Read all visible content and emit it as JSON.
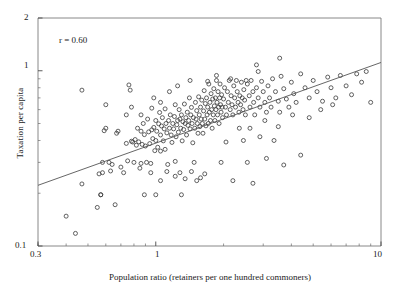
{
  "chart_data": {
    "type": "scatter",
    "title": "",
    "xlabel": "Population ratio (retainers per one hundred commoners)",
    "ylabel": "Taxation per capita",
    "xscale": "log",
    "yscale": "log",
    "xlim": [
      0.3,
      10
    ],
    "ylim": [
      0.1,
      2
    ],
    "xticks": [
      0.3,
      1,
      10
    ],
    "xtick_labels": [
      "0.3",
      "1",
      "10"
    ],
    "yticks": [
      0.1,
      1,
      2
    ],
    "ytick_labels": [
      "0.1",
      "1",
      "2"
    ],
    "grid": false,
    "legend": null,
    "annotations": [
      {
        "text": "r = 0.60",
        "x": 0.45,
        "y": 1.45
      }
    ],
    "correlation": 0.6,
    "marker": {
      "shape": "open-circle",
      "size_px": 4,
      "facecolor": "none",
      "edgecolor": "#3a3a3a"
    },
    "trendline": {
      "type": "linear-in-log-log",
      "color": "#555555",
      "points": [
        [
          0.3,
          0.222
        ],
        [
          10.0,
          1.115
        ]
      ]
    },
    "points": [
      [
        0.4,
        0.148
      ],
      [
        0.44,
        0.118
      ],
      [
        0.47,
        0.226
      ],
      [
        0.47,
        0.775
      ],
      [
        0.55,
        0.166
      ],
      [
        0.56,
        0.258
      ],
      [
        0.57,
        0.196
      ],
      [
        0.57,
        0.196
      ],
      [
        0.58,
        0.262
      ],
      [
        0.58,
        0.3
      ],
      [
        0.59,
        0.455
      ],
      [
        0.6,
        0.47
      ],
      [
        0.6,
        0.64
      ],
      [
        0.62,
        0.3
      ],
      [
        0.63,
        0.268
      ],
      [
        0.64,
        0.292
      ],
      [
        0.66,
        0.172
      ],
      [
        0.67,
        0.44
      ],
      [
        0.68,
        0.452
      ],
      [
        0.7,
        0.282
      ],
      [
        0.72,
        0.262
      ],
      [
        0.74,
        0.385
      ],
      [
        0.75,
        0.306
      ],
      [
        0.76,
        0.83
      ],
      [
        0.77,
        0.775
      ],
      [
        0.78,
        0.396
      ],
      [
        0.79,
        0.392
      ],
      [
        0.8,
        0.3
      ],
      [
        0.81,
        0.405
      ],
      [
        0.82,
        0.376
      ],
      [
        0.83,
        0.47
      ],
      [
        0.84,
        0.393
      ],
      [
        0.85,
        0.278
      ],
      [
        0.86,
        0.452
      ],
      [
        0.86,
        0.296
      ],
      [
        0.87,
        0.38
      ],
      [
        0.88,
        0.5
      ],
      [
        0.89,
        0.196
      ],
      [
        0.89,
        0.432
      ],
      [
        0.9,
        0.372
      ],
      [
        0.91,
        0.3
      ],
      [
        0.92,
        0.53
      ],
      [
        0.93,
        0.448
      ],
      [
        0.94,
        0.384
      ],
      [
        0.95,
        0.296
      ],
      [
        0.96,
        0.46
      ],
      [
        0.96,
        0.612
      ],
      [
        0.97,
        0.41
      ],
      [
        0.98,
        0.475
      ],
      [
        0.99,
        0.35
      ],
      [
        1.0,
        0.52
      ],
      [
        1.0,
        0.4
      ],
      [
        1.01,
        0.452
      ],
      [
        1.02,
        0.366
      ],
      [
        1.03,
        0.498
      ],
      [
        1.04,
        0.578
      ],
      [
        1.05,
        0.43
      ],
      [
        1.05,
        0.348
      ],
      [
        1.06,
        0.484
      ],
      [
        1.07,
        0.54
      ],
      [
        1.08,
        0.398
      ],
      [
        1.09,
        0.466
      ],
      [
        1.1,
        0.356
      ],
      [
        1.1,
        0.606
      ],
      [
        1.11,
        0.5
      ],
      [
        1.12,
        0.442
      ],
      [
        1.13,
        0.292
      ],
      [
        1.14,
        0.52
      ],
      [
        1.15,
        0.47
      ],
      [
        1.16,
        0.56
      ],
      [
        1.17,
        0.43
      ],
      [
        1.18,
        0.39
      ],
      [
        1.19,
        0.5
      ],
      [
        1.2,
        0.466
      ],
      [
        1.21,
        0.548
      ],
      [
        1.22,
        0.64
      ],
      [
        1.22,
        0.304
      ],
      [
        1.23,
        0.42
      ],
      [
        1.24,
        0.492
      ],
      [
        1.25,
        0.52
      ],
      [
        1.26,
        0.446
      ],
      [
        1.27,
        0.6
      ],
      [
        1.28,
        0.53
      ],
      [
        1.29,
        0.47
      ],
      [
        1.3,
        0.56
      ],
      [
        1.31,
        0.398
      ],
      [
        1.32,
        0.512
      ],
      [
        1.33,
        0.462
      ],
      [
        1.34,
        0.646
      ],
      [
        1.35,
        0.5
      ],
      [
        1.36,
        0.54
      ],
      [
        1.37,
        0.43
      ],
      [
        1.38,
        0.58
      ],
      [
        1.39,
        0.488
      ],
      [
        1.4,
        0.52
      ],
      [
        1.41,
        0.7
      ],
      [
        1.42,
        0.466
      ],
      [
        1.43,
        0.56
      ],
      [
        1.44,
        0.618
      ],
      [
        1.45,
        0.5
      ],
      [
        1.46,
        0.388
      ],
      [
        1.47,
        0.54
      ],
      [
        1.48,
        0.3
      ],
      [
        1.49,
        0.47
      ],
      [
        1.5,
        0.66
      ],
      [
        1.51,
        0.53
      ],
      [
        1.52,
        0.592
      ],
      [
        1.53,
        0.5
      ],
      [
        1.54,
        0.44
      ],
      [
        1.55,
        0.71
      ],
      [
        1.56,
        0.56
      ],
      [
        1.57,
        0.48
      ],
      [
        1.58,
        0.62
      ],
      [
        1.59,
        0.53
      ],
      [
        1.6,
        0.68
      ],
      [
        1.61,
        0.5
      ],
      [
        1.62,
        0.44
      ],
      [
        1.63,
        0.59
      ],
      [
        1.64,
        0.77
      ],
      [
        1.65,
        0.53
      ],
      [
        1.66,
        0.65
      ],
      [
        1.67,
        0.485
      ],
      [
        1.68,
        0.7
      ],
      [
        1.69,
        0.56
      ],
      [
        1.7,
        0.62
      ],
      [
        1.71,
        0.5
      ],
      [
        1.72,
        0.84
      ],
      [
        1.73,
        0.58
      ],
      [
        1.74,
        0.66
      ],
      [
        1.75,
        0.52
      ],
      [
        1.76,
        0.74
      ],
      [
        1.77,
        0.6
      ],
      [
        1.78,
        0.47
      ],
      [
        1.79,
        0.69
      ],
      [
        1.8,
        0.56
      ],
      [
        1.81,
        0.79
      ],
      [
        1.82,
        0.63
      ],
      [
        1.83,
        0.52
      ],
      [
        1.84,
        0.7
      ],
      [
        1.85,
        0.6
      ],
      [
        1.86,
        0.88
      ],
      [
        1.87,
        0.66
      ],
      [
        1.88,
        0.56
      ],
      [
        1.89,
        0.76
      ],
      [
        1.9,
        0.62
      ],
      [
        1.91,
        0.5
      ],
      [
        1.92,
        0.7
      ],
      [
        1.93,
        0.84
      ],
      [
        1.94,
        0.64
      ],
      [
        1.95,
        0.58
      ],
      [
        1.96,
        0.73
      ],
      [
        1.97,
        0.62
      ],
      [
        1.98,
        0.54
      ],
      [
        2.0,
        0.69
      ],
      [
        2.02,
        0.8
      ],
      [
        2.04,
        0.62
      ],
      [
        2.06,
        0.56
      ],
      [
        2.08,
        0.76
      ],
      [
        2.1,
        0.66
      ],
      [
        2.12,
        0.88
      ],
      [
        2.14,
        0.6
      ],
      [
        2.16,
        0.72
      ],
      [
        2.18,
        0.64
      ],
      [
        2.2,
        0.56
      ],
      [
        2.22,
        0.82
      ],
      [
        2.24,
        0.7
      ],
      [
        2.26,
        0.62
      ],
      [
        2.28,
        0.88
      ],
      [
        2.3,
        0.76
      ],
      [
        2.32,
        0.66
      ],
      [
        2.34,
        0.58
      ],
      [
        2.36,
        0.72
      ],
      [
        2.38,
        0.64
      ],
      [
        2.4,
        0.86
      ],
      [
        2.42,
        0.7
      ],
      [
        2.44,
        0.6
      ],
      [
        2.46,
        0.78
      ],
      [
        2.48,
        0.68
      ],
      [
        2.5,
        0.56
      ],
      [
        2.55,
        0.84
      ],
      [
        2.6,
        0.72
      ],
      [
        2.62,
        0.62
      ],
      [
        2.65,
        0.88
      ],
      [
        2.7,
        0.76
      ],
      [
        2.72,
        0.66
      ],
      [
        2.75,
        0.56
      ],
      [
        2.8,
        0.8
      ],
      [
        2.85,
        0.7
      ],
      [
        2.9,
        0.62
      ],
      [
        2.95,
        0.87
      ],
      [
        3.0,
        0.76
      ],
      [
        3.05,
        0.66
      ],
      [
        3.1,
        0.58
      ],
      [
        3.15,
        0.82
      ],
      [
        3.2,
        0.7
      ],
      [
        3.25,
        0.62
      ],
      [
        3.3,
        0.9
      ],
      [
        3.4,
        0.76
      ],
      [
        3.5,
        0.67
      ],
      [
        3.55,
        0.58
      ],
      [
        3.6,
        0.93
      ],
      [
        3.7,
        0.79
      ],
      [
        3.8,
        0.69
      ],
      [
        3.9,
        0.62
      ],
      [
        4.0,
        0.86
      ],
      [
        4.1,
        0.74
      ],
      [
        4.2,
        0.66
      ],
      [
        4.4,
        0.96
      ],
      [
        4.6,
        0.8
      ],
      [
        4.8,
        0.7
      ],
      [
        5.0,
        0.88
      ],
      [
        5.2,
        0.76
      ],
      [
        5.5,
        0.67
      ],
      [
        5.8,
        0.92
      ],
      [
        6.0,
        0.8
      ],
      [
        6.3,
        0.7
      ],
      [
        6.6,
        0.94
      ],
      [
        7.0,
        0.82
      ],
      [
        7.4,
        0.73
      ],
      [
        7.8,
        0.96
      ],
      [
        8.2,
        0.86
      ],
      [
        8.6,
        0.99
      ],
      [
        9.0,
        0.66
      ],
      [
        1.05,
        0.236
      ],
      [
        1.22,
        0.25
      ],
      [
        1.35,
        0.242
      ],
      [
        1.52,
        0.236
      ],
      [
        1.65,
        0.258
      ],
      [
        1.12,
        0.266
      ],
      [
        1.28,
        0.262
      ],
      [
        1.44,
        0.266
      ],
      [
        1.58,
        0.245
      ],
      [
        0.95,
        0.262
      ],
      [
        1.0,
        0.196
      ],
      [
        1.3,
        0.196
      ],
      [
        2.2,
        0.236
      ],
      [
        2.7,
        0.228
      ],
      [
        2.55,
        0.3
      ],
      [
        3.1,
        0.316
      ],
      [
        3.7,
        0.29
      ],
      [
        4.4,
        0.33
      ],
      [
        2.9,
        0.42
      ],
      [
        3.35,
        0.4
      ],
      [
        2.45,
        0.4
      ],
      [
        2.05,
        0.392
      ],
      [
        1.95,
        0.3
      ],
      [
        2.35,
        0.47
      ],
      [
        2.62,
        0.47
      ],
      [
        3.05,
        0.52
      ],
      [
        3.5,
        0.48
      ],
      [
        4.05,
        0.56
      ],
      [
        4.8,
        0.54
      ],
      [
        5.4,
        0.6
      ],
      [
        6.1,
        0.64
      ],
      [
        2.85,
        0.99
      ],
      [
        2.8,
        1.08
      ],
      [
        3.55,
        1.18
      ],
      [
        2.52,
        0.88
      ],
      [
        2.15,
        0.9
      ],
      [
        1.86,
        0.94
      ],
      [
        1.7,
        0.87
      ],
      [
        1.42,
        0.88
      ],
      [
        1.25,
        0.82
      ],
      [
        1.15,
        0.76
      ],
      [
        0.74,
        0.56
      ],
      [
        0.86,
        0.56
      ],
      [
        0.78,
        0.62
      ],
      [
        1.05,
        0.66
      ],
      [
        0.98,
        0.7
      ]
    ]
  }
}
